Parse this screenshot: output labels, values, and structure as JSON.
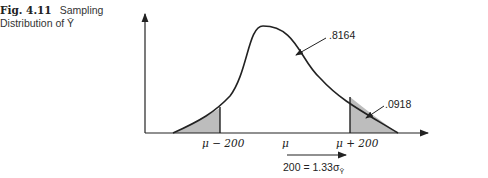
{
  "figure": {
    "number": "Fig. 4.11",
    "title_line1": "Sampling",
    "title_line2": "Distribution of Ȳ"
  },
  "diagram": {
    "type": "normal-distribution-curve",
    "shaded_regions": [
      "left tail below μ − 200",
      "right tail above μ + 200"
    ],
    "annotations": {
      "center_area": ".8164",
      "tail_area": ".0918"
    },
    "x_labels": {
      "left": "μ − 200",
      "center": "μ",
      "right": "μ + 200"
    },
    "distance_note": "200 = 1.33σ",
    "distance_subscript": "Ȳ",
    "colors": {
      "line": "#222222",
      "shade": "#bdbdbd"
    }
  }
}
